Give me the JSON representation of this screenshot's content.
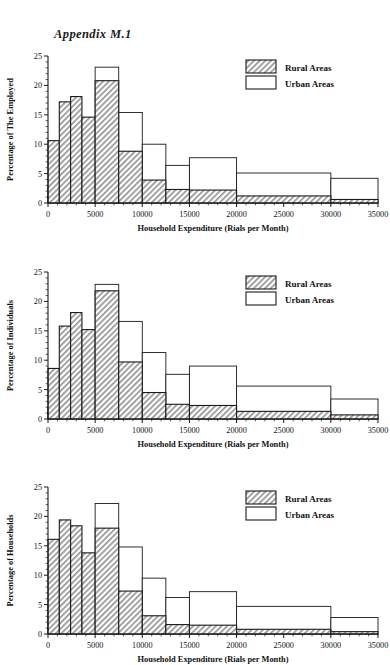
{
  "document": {
    "title": "Appendix M.1"
  },
  "legend": {
    "rural_label": "Rural Areas",
    "urban_label": "Urban Areas",
    "rural_color": "#cfcfcf",
    "urban_color": "#ffffff",
    "outline_color": "#1a1a1a"
  },
  "axis": {
    "xlabel": "Household Expenditure (Rials per Month)",
    "xticks": [
      "0",
      "5000",
      "10000",
      "15000",
      "20000",
      "25000",
      "30000",
      "35000"
    ],
    "xtick_values": [
      0,
      5000,
      10000,
      15000,
      20000,
      25000,
      30000,
      35000
    ],
    "yticks": [
      "0",
      "5",
      "10",
      "15",
      "20",
      "25"
    ],
    "ytick_values": [
      0,
      5,
      10,
      15,
      20,
      25
    ],
    "xlim": [
      0,
      35000
    ],
    "ylim": [
      0,
      25
    ]
  },
  "charts": [
    {
      "id": "employed",
      "ylabel": "Percentage of The Employed"
    },
    {
      "id": "individuals",
      "ylabel": "Percentage of Individuals"
    },
    {
      "id": "households",
      "ylabel": "Percentage of Households"
    }
  ],
  "chart_data": [
    {
      "type": "bar",
      "title": "Appendix M.1",
      "subtitle": "Distribution of The Employed by Household Expenditure",
      "xlabel": "Household Expenditure (Rials per Month)",
      "ylabel": "Percentage of The Employed",
      "xlim": [
        0,
        35000
      ],
      "ylim": [
        0,
        25
      ],
      "grid": false,
      "legend_position": "top-right",
      "bin_edges": [
        1200,
        2400,
        3600,
        5000,
        7500,
        10000,
        12500,
        15000,
        20000,
        30000,
        35000
      ],
      "series": [
        {
          "name": "Rural Areas",
          "fill": "hatched",
          "values": [
            10.6,
            17.2,
            18.1,
            14.6,
            20.8,
            8.8,
            3.9,
            2.3,
            2.2,
            1.2,
            0.6
          ]
        },
        {
          "name": "Urban Areas",
          "fill": "open",
          "values": [
            2.6,
            5.9,
            10.0,
            10.6,
            23.1,
            15.4,
            10.0,
            6.4,
            7.7,
            5.1,
            4.2
          ]
        }
      ]
    },
    {
      "type": "bar",
      "subtitle": "Distribution of Individuals by Household Expenditure",
      "xlabel": "Household Expenditure (Rials per Month)",
      "ylabel": "Percentage of Individuals",
      "xlim": [
        0,
        35000
      ],
      "ylim": [
        0,
        25
      ],
      "grid": false,
      "legend_position": "top-right",
      "bin_edges": [
        1200,
        2400,
        3600,
        5000,
        7500,
        10000,
        12500,
        15000,
        20000,
        30000,
        35000
      ],
      "series": [
        {
          "name": "Rural Areas",
          "fill": "hatched",
          "values": [
            8.6,
            15.8,
            18.1,
            15.2,
            21.8,
            9.7,
            4.5,
            2.5,
            2.3,
            1.3,
            0.7
          ]
        },
        {
          "name": "Urban Areas",
          "fill": "open",
          "values": [
            1.9,
            4.7,
            8.3,
            9.8,
            22.9,
            16.6,
            11.3,
            7.6,
            9.0,
            5.6,
            3.4
          ]
        }
      ]
    },
    {
      "type": "bar",
      "subtitle": "Distribution of Households by Household Expenditure",
      "xlabel": "Household Expenditure (Rials per Month)",
      "ylabel": "Percentage of Households",
      "xlim": [
        0,
        35000
      ],
      "ylim": [
        0,
        25
      ],
      "grid": false,
      "legend_position": "top-right",
      "bin_edges": [
        1200,
        2400,
        3600,
        5000,
        7500,
        10000,
        12500,
        15000,
        20000,
        30000,
        35000
      ],
      "series": [
        {
          "name": "Rural Areas",
          "fill": "hatched",
          "values": [
            16.1,
            19.4,
            18.4,
            13.8,
            18.0,
            7.3,
            3.1,
            1.6,
            1.5,
            0.8,
            0.4
          ]
        },
        {
          "name": "Urban Areas",
          "fill": "open",
          "values": [
            4.9,
            7.3,
            10.3,
            10.6,
            22.2,
            14.8,
            9.5,
            6.2,
            7.2,
            4.7,
            2.8
          ]
        }
      ]
    }
  ]
}
